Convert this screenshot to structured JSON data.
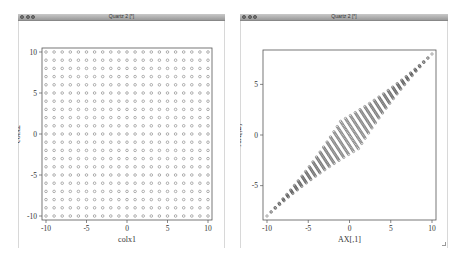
{
  "windows": [
    {
      "title": "Quartz 2 [*]",
      "plot": {
        "xlabel": "colx1",
        "ylabel": "colx2",
        "xticks": [
          "-10",
          "-5",
          "0",
          "5",
          "10"
        ],
        "yticks": [
          "-10",
          "-5",
          "0",
          "5",
          "10"
        ]
      }
    },
    {
      "title": "Quartz 2 [*]",
      "plot": {
        "xlabel": "AX[,1]",
        "ylabel": "AX[,2]",
        "xticks": [
          "-10",
          "-5",
          "0",
          "5",
          "10"
        ],
        "yticks": [
          "-5",
          "0",
          "5"
        ]
      }
    }
  ],
  "chart_data": [
    {
      "type": "scatter",
      "title": "",
      "xlabel": "colx1",
      "ylabel": "colx2",
      "xlim": [
        -10,
        10
      ],
      "ylim": [
        -10,
        10
      ],
      "description": "Regular grid of open circles, x and y from -10 to 10 in steps of 1 (21x21 points)",
      "x_grid": [
        -10,
        -9,
        -8,
        -7,
        -6,
        -5,
        -4,
        -3,
        -2,
        -1,
        0,
        1,
        2,
        3,
        4,
        5,
        6,
        7,
        8,
        9,
        10
      ],
      "y_grid": [
        -10,
        -9,
        -8,
        -7,
        -6,
        -5,
        -4,
        -3,
        -2,
        -1,
        0,
        1,
        2,
        3,
        4,
        5,
        6,
        7,
        8,
        9,
        10
      ],
      "marker": "open-circle",
      "grid": false
    },
    {
      "type": "scatter",
      "title": "",
      "xlabel": "AX[,1]",
      "ylabel": "AX[,2]",
      "xlim": [
        -10,
        10
      ],
      "ylim": [
        -8,
        8
      ],
      "description": "Linear transform of the grid: points form a narrow dense band along a diagonal from about (-10,-8) to (10,8)",
      "transform_approx": {
        "a11": 0.5,
        "a12": 0.5,
        "a21": 0.4,
        "a22": 0.4,
        "spread": 0.08
      },
      "marker": "open-circle",
      "grid": false
    }
  ]
}
